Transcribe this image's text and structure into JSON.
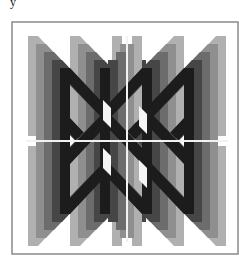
{
  "figure": {
    "top_fragment": "y",
    "frame": {
      "x": 12,
      "y": 22,
      "width": 226,
      "height": 232,
      "stroke": "#8a8a8a"
    },
    "background": "#ffffff",
    "divider_color": "#f2f2f2",
    "dividers": {
      "vertical": {
        "x": 127,
        "y1": 36,
        "y2": 242
      },
      "horizontal": {
        "y": 141,
        "x1": 26,
        "x2": 228
      }
    },
    "glyph": "N",
    "glyph_size": {
      "width": 52,
      "height": 50,
      "stem": 10
    },
    "layer_tones": [
      "#b0b0b0",
      "#8f8f8f",
      "#6c6c6c",
      "#464646",
      "#1c1c1c"
    ],
    "layer_step": 8,
    "quadrants": [
      {
        "name": "top-left",
        "origins": [
          [
            28,
            36
          ],
          [
            70,
            36
          ],
          [
            28,
            86
          ],
          [
            70,
            86
          ]
        ],
        "dir": [
          1,
          1
        ]
      },
      {
        "name": "top-right",
        "origins": [
          [
            174,
            36
          ],
          [
            132,
            36
          ],
          [
            174,
            86
          ],
          [
            132,
            86
          ]
        ],
        "dir": [
          -1,
          1
        ]
      },
      {
        "name": "bottom-left",
        "origins": [
          [
            28,
            196
          ],
          [
            70,
            196
          ],
          [
            28,
            146
          ],
          [
            70,
            146
          ]
        ],
        "dir": [
          1,
          -1
        ]
      },
      {
        "name": "bottom-right",
        "origins": [
          [
            174,
            196
          ],
          [
            132,
            196
          ],
          [
            174,
            146
          ],
          [
            132,
            146
          ]
        ],
        "dir": [
          -1,
          -1
        ]
      }
    ]
  }
}
